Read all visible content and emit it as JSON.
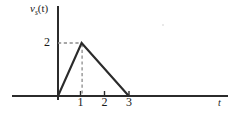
{
  "figure": {
    "y_axis_label": "v",
    "y_axis_label_sub": "s",
    "y_axis_label_arg": "(t)",
    "x_axis_label": "t",
    "ink_color": "#2b2b2b",
    "dash_color": "#8c8c8c"
  },
  "chart_data": {
    "type": "line",
    "title": "",
    "xlabel": "t",
    "ylabel": "v_s(t)",
    "x": [
      0,
      1,
      3,
      5
    ],
    "y": [
      0,
      2,
      0,
      0
    ],
    "series": [
      {
        "name": "v_s(t)",
        "x": [
          0,
          1,
          3,
          5
        ],
        "values": [
          0,
          2,
          0,
          0
        ]
      }
    ],
    "xlim": [
      -1.1,
      6.9
    ],
    "ylim": [
      0,
      2.45
    ],
    "xticks": [
      1,
      2,
      3
    ],
    "xtick_labels": [
      "1",
      "2",
      "3"
    ],
    "yticks": [
      2
    ],
    "ytick_labels": [
      "2"
    ],
    "grid": false,
    "legend": false,
    "annotations": [
      {
        "name": "peak-guide-horizontal",
        "style": "dashed",
        "from": [
          0,
          2
        ],
        "to": [
          1,
          2
        ]
      },
      {
        "name": "peak-guide-vertical",
        "style": "dashed",
        "from": [
          1,
          0
        ],
        "to": [
          1,
          2
        ]
      }
    ]
  }
}
